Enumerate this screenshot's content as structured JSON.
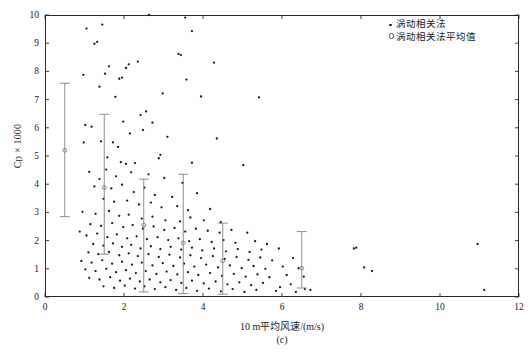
{
  "figure": {
    "panel_caption": "(c)",
    "x_axis_title": "10 m平均风速/(m/s)",
    "y_axis_title_main": "C",
    "y_axis_title_sub": "D",
    "y_axis_title_rest": " × 1000"
  },
  "legend": {
    "position": "top-right",
    "items": [
      {
        "marker": "filled-dot",
        "label": "涡动相关法"
      },
      {
        "marker": "open-circle",
        "label": "涡动相关法平均值"
      }
    ]
  },
  "chart_data": {
    "type": "scatter",
    "title": "",
    "xlabel": "10 m平均风速/(m/s)",
    "ylabel": "C_D × 1000",
    "xlim": [
      0,
      12
    ],
    "ylim": [
      0,
      10
    ],
    "xticks": [
      0,
      2,
      4,
      6,
      8,
      10,
      12
    ],
    "yticks": [
      0,
      1,
      2,
      3,
      4,
      5,
      6,
      7,
      8,
      9,
      10
    ],
    "grid": false,
    "marker_color": "#1a1a1a",
    "errorbar_color": "#7a7a7a",
    "frame_color": "#2b2b2b",
    "series": [
      {
        "name": "涡动相关法",
        "marker": "filled-dot",
        "points": [
          [
            1.05,
            9.52
          ],
          [
            1.45,
            9.66
          ],
          [
            3.55,
            9.91
          ],
          [
            3.72,
            9.43
          ],
          [
            1.25,
            8.98
          ],
          [
            1.32,
            9.05
          ],
          [
            2.63,
            10.0
          ],
          [
            3.38,
            8.62
          ],
          [
            3.44,
            8.58
          ],
          [
            0.97,
            7.88
          ],
          [
            1.62,
            8.18
          ],
          [
            1.52,
            7.92
          ],
          [
            2.05,
            8.12
          ],
          [
            2.12,
            8.25
          ],
          [
            2.35,
            8.35
          ],
          [
            4.28,
            8.31
          ],
          [
            1.38,
            7.46
          ],
          [
            1.88,
            7.74
          ],
          [
            1.95,
            7.78
          ],
          [
            1.78,
            7.1
          ],
          [
            2.98,
            7.22
          ],
          [
            3.58,
            7.71
          ],
          [
            3.95,
            7.11
          ],
          [
            5.42,
            7.08
          ],
          [
            1.02,
            6.1
          ],
          [
            1.18,
            6.04
          ],
          [
            1.98,
            6.22
          ],
          [
            2.42,
            6.45
          ],
          [
            2.56,
            6.58
          ],
          [
            2.72,
            6.18
          ],
          [
            2.48,
            5.92
          ],
          [
            0.98,
            5.48
          ],
          [
            1.42,
            5.52
          ],
          [
            1.72,
            5.48
          ],
          [
            1.85,
            5.32
          ],
          [
            2.15,
            5.8
          ],
          [
            3.1,
            5.68
          ],
          [
            4.35,
            5.62
          ],
          [
            2.92,
            5.04
          ],
          [
            1.58,
            4.95
          ],
          [
            1.92,
            4.78
          ],
          [
            2.05,
            4.72
          ],
          [
            2.28,
            4.75
          ],
          [
            2.88,
            4.92
          ],
          [
            3.72,
            4.76
          ],
          [
            5.02,
            4.68
          ],
          [
            1.8,
            4.28
          ],
          [
            1.12,
            4.44
          ],
          [
            1.55,
            4.52
          ],
          [
            2.18,
            4.42
          ],
          [
            2.62,
            4.35
          ],
          [
            3.02,
            4.22
          ],
          [
            3.48,
            4.05
          ],
          [
            1.38,
            4.18
          ],
          [
            1.25,
            3.92
          ],
          [
            1.68,
            3.85
          ],
          [
            1.95,
            3.98
          ],
          [
            2.25,
            3.72
          ],
          [
            2.52,
            3.88
          ],
          [
            2.78,
            3.62
          ],
          [
            3.22,
            3.55
          ],
          [
            3.85,
            3.68
          ],
          [
            1.48,
            3.48
          ],
          [
            1.75,
            3.38
          ],
          [
            2.08,
            3.42
          ],
          [
            2.38,
            3.28
          ],
          [
            2.68,
            3.35
          ],
          [
            2.95,
            3.18
          ],
          [
            3.35,
            3.22
          ],
          [
            3.62,
            3.08
          ],
          [
            4.18,
            3.12
          ],
          [
            0.95,
            3.02
          ],
          [
            1.28,
            2.95
          ],
          [
            1.62,
            3.05
          ],
          [
            1.88,
            2.88
          ],
          [
            2.12,
            2.92
          ],
          [
            2.45,
            2.78
          ],
          [
            2.72,
            2.85
          ],
          [
            3.05,
            2.72
          ],
          [
            3.42,
            2.68
          ],
          [
            3.68,
            2.82
          ],
          [
            4.02,
            2.72
          ],
          [
            4.45,
            2.65
          ],
          [
            1.15,
            2.58
          ],
          [
            1.42,
            2.52
          ],
          [
            1.7,
            2.62
          ],
          [
            1.98,
            2.48
          ],
          [
            2.22,
            2.55
          ],
          [
            2.48,
            2.42
          ],
          [
            2.75,
            2.5
          ],
          [
            3.02,
            2.38
          ],
          [
            3.28,
            2.45
          ],
          [
            3.55,
            2.32
          ],
          [
            3.82,
            2.42
          ],
          [
            4.12,
            2.35
          ],
          [
            4.42,
            2.28
          ],
          [
            4.72,
            2.38
          ],
          [
            5.12,
            2.28
          ],
          [
            0.88,
            2.32
          ],
          [
            1.05,
            2.18
          ],
          [
            1.32,
            2.25
          ],
          [
            1.58,
            2.12
          ],
          [
            1.82,
            2.22
          ],
          [
            2.08,
            2.08
          ],
          [
            2.32,
            2.15
          ],
          [
            2.58,
            2.05
          ],
          [
            2.85,
            2.12
          ],
          [
            3.12,
            2.02
          ],
          [
            3.38,
            2.08
          ],
          [
            3.65,
            1.98
          ],
          [
            3.92,
            2.05
          ],
          [
            4.22,
            1.95
          ],
          [
            4.52,
            2.02
          ],
          [
            4.82,
            1.92
          ],
          [
            5.32,
            1.98
          ],
          [
            5.62,
            1.88
          ],
          [
            1.22,
            1.88
          ],
          [
            1.48,
            1.82
          ],
          [
            1.72,
            1.9
          ],
          [
            1.95,
            1.78
          ],
          [
            2.18,
            1.85
          ],
          [
            2.42,
            1.72
          ],
          [
            2.68,
            1.8
          ],
          [
            2.92,
            1.7
          ],
          [
            3.18,
            1.78
          ],
          [
            3.45,
            1.68
          ],
          [
            3.72,
            1.75
          ],
          [
            3.98,
            1.65
          ],
          [
            4.28,
            1.72
          ],
          [
            4.58,
            1.62
          ],
          [
            4.88,
            1.7
          ],
          [
            5.18,
            1.6
          ],
          [
            5.48,
            1.68
          ],
          [
            5.92,
            1.72
          ],
          [
            1.1,
            1.58
          ],
          [
            1.35,
            1.52
          ],
          [
            1.62,
            1.6
          ],
          [
            1.88,
            1.48
          ],
          [
            2.12,
            1.55
          ],
          [
            2.35,
            1.45
          ],
          [
            2.62,
            1.52
          ],
          [
            2.88,
            1.42
          ],
          [
            3.15,
            1.5
          ],
          [
            3.42,
            1.4
          ],
          [
            3.68,
            1.48
          ],
          [
            3.95,
            1.38
          ],
          [
            4.25,
            1.45
          ],
          [
            4.55,
            1.35
          ],
          [
            4.85,
            1.42
          ],
          [
            5.15,
            1.32
          ],
          [
            5.45,
            1.4
          ],
          [
            5.75,
            1.3
          ],
          [
            6.28,
            1.38
          ],
          [
            0.92,
            1.28
          ],
          [
            1.18,
            1.22
          ],
          [
            1.45,
            1.3
          ],
          [
            1.7,
            1.18
          ],
          [
            1.95,
            1.25
          ],
          [
            2.2,
            1.15
          ],
          [
            2.45,
            1.22
          ],
          [
            2.72,
            1.12
          ],
          [
            2.98,
            1.2
          ],
          [
            3.25,
            1.1
          ],
          [
            3.52,
            1.18
          ],
          [
            3.78,
            1.08
          ],
          [
            4.08,
            1.15
          ],
          [
            4.38,
            1.05
          ],
          [
            4.68,
            1.12
          ],
          [
            4.98,
            1.02
          ],
          [
            5.28,
            1.1
          ],
          [
            5.58,
            1.0
          ],
          [
            6.02,
            1.08
          ],
          [
            6.42,
            1.02
          ],
          [
            1.02,
            0.98
          ],
          [
            1.28,
            0.92
          ],
          [
            1.55,
            1.0
          ],
          [
            1.8,
            0.88
          ],
          [
            2.05,
            0.95
          ],
          [
            2.3,
            0.85
          ],
          [
            2.55,
            0.92
          ],
          [
            2.82,
            0.82
          ],
          [
            3.08,
            0.9
          ],
          [
            3.35,
            0.8
          ],
          [
            3.62,
            0.88
          ],
          [
            3.88,
            0.78
          ],
          [
            4.18,
            0.85
          ],
          [
            4.48,
            0.75
          ],
          [
            4.78,
            0.82
          ],
          [
            5.08,
            0.72
          ],
          [
            5.38,
            0.8
          ],
          [
            5.68,
            0.7
          ],
          [
            6.12,
            0.78
          ],
          [
            6.55,
            0.72
          ],
          [
            1.12,
            0.68
          ],
          [
            1.38,
            0.62
          ],
          [
            1.65,
            0.7
          ],
          [
            1.9,
            0.58
          ],
          [
            2.15,
            0.65
          ],
          [
            2.4,
            0.55
          ],
          [
            2.65,
            0.62
          ],
          [
            2.92,
            0.52
          ],
          [
            3.18,
            0.6
          ],
          [
            3.45,
            0.5
          ],
          [
            3.72,
            0.58
          ],
          [
            4.02,
            0.48
          ],
          [
            4.32,
            0.55
          ],
          [
            4.62,
            0.45
          ],
          [
            4.92,
            0.52
          ],
          [
            5.22,
            0.42
          ],
          [
            5.52,
            0.5
          ],
          [
            6.22,
            0.45
          ],
          [
            1.48,
            0.38
          ],
          [
            1.75,
            0.32
          ],
          [
            2.02,
            0.4
          ],
          [
            2.28,
            0.3
          ],
          [
            2.52,
            0.38
          ],
          [
            2.78,
            0.28
          ],
          [
            3.05,
            0.35
          ],
          [
            3.32,
            0.25
          ],
          [
            3.58,
            0.32
          ],
          [
            3.85,
            0.22
          ],
          [
            4.15,
            0.3
          ],
          [
            4.45,
            0.2
          ],
          [
            4.75,
            0.28
          ],
          [
            5.05,
            0.18
          ],
          [
            5.35,
            0.25
          ],
          [
            5.85,
            0.22
          ],
          [
            6.35,
            0.18
          ],
          [
            7.82,
            1.72
          ],
          [
            7.88,
            1.75
          ],
          [
            8.08,
            1.05
          ],
          [
            8.28,
            0.92
          ],
          [
            10.95,
            1.88
          ],
          [
            11.12,
            0.25
          ],
          [
            6.58,
            0.28
          ],
          [
            6.72,
            0.25
          ],
          [
            5.95,
            0.35
          ]
        ]
      },
      {
        "name": "涡动相关法平均值",
        "marker": "open-circle",
        "points": [
          {
            "x": 0.5,
            "y": 5.2,
            "low": 2.85,
            "high": 7.58
          },
          {
            "x": 1.5,
            "y": 3.88,
            "low": 1.52,
            "high": 6.48
          },
          {
            "x": 2.5,
            "y": 2.55,
            "low": 0.18,
            "high": 4.18
          },
          {
            "x": 3.5,
            "y": 1.92,
            "low": 0.12,
            "high": 4.35
          },
          {
            "x": 4.5,
            "y": 1.28,
            "low": 0.1,
            "high": 2.62
          },
          {
            "x": 6.5,
            "y": 1.02,
            "low": 0.32,
            "high": 2.32
          }
        ]
      }
    ]
  }
}
